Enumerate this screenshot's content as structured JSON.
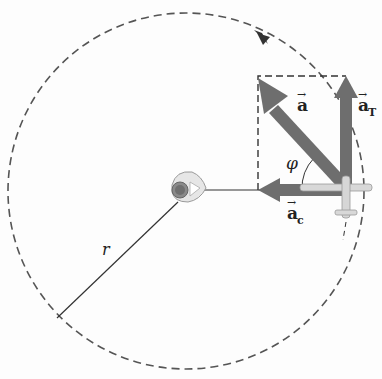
{
  "diagram": {
    "type": "physics-vector-diagram",
    "labels": {
      "total_acceleration": "a",
      "tangential_acceleration": "a",
      "tangential_subscript": "T",
      "centripetal_acceleration": "a",
      "centripetal_subscript": "c",
      "angle": "φ",
      "radius": "r",
      "vector_arrow": "→"
    },
    "colors": {
      "vector": "#6e6e6e",
      "path": "#555555",
      "radius_line": "#333333",
      "plane_body": "#d8d8d8"
    },
    "elements": [
      {
        "name": "circular-path",
        "style": "dashed",
        "direction": "counterclockwise"
      },
      {
        "name": "pilot-at-center"
      },
      {
        "name": "airplane"
      },
      {
        "name": "vector-a"
      },
      {
        "name": "vector-a-T"
      },
      {
        "name": "vector-a-c"
      },
      {
        "name": "component-rectangle",
        "style": "dashed"
      }
    ]
  }
}
